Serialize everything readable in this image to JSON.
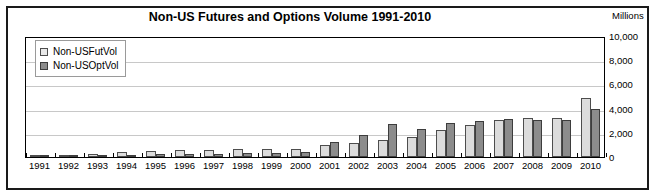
{
  "chart_data": {
    "type": "bar",
    "title": "Non-US Futures and Options Volume 1991-2010",
    "units_label": "Millions",
    "xlabel": "",
    "ylabel": "Millions",
    "ylim": [
      0,
      10000
    ],
    "ytick_labels": [
      "10,000",
      "8,000",
      "6,000",
      "4,000",
      "2,000",
      "0"
    ],
    "ytick_values": [
      10000,
      8000,
      6000,
      4000,
      2000,
      0
    ],
    "grid": true,
    "legend_position": "top-left",
    "categories": [
      "1991",
      "1992",
      "1993",
      "1994",
      "1995",
      "1996",
      "1997",
      "1998",
      "1999",
      "2000",
      "2001",
      "2002",
      "2003",
      "2004",
      "2005",
      "2006",
      "2007",
      "2008",
      "2009",
      "2010"
    ],
    "series": [
      {
        "name": "Non-USFutVol",
        "color": "#dcdcdc",
        "values": [
          80,
          170,
          290,
          420,
          470,
          560,
          590,
          640,
          640,
          690,
          1020,
          1180,
          1420,
          1620,
          2220,
          2610,
          3020,
          3240,
          3200,
          4890
        ]
      },
      {
        "name": "Non-USOptVol",
        "color": "#8c8c8c",
        "values": [
          40,
          70,
          140,
          200,
          210,
          250,
          280,
          310,
          320,
          420,
          1230,
          1860,
          2700,
          2340,
          2820,
          2950,
          3180,
          3080,
          3070,
          3930
        ]
      }
    ]
  },
  "legend": {
    "items": [
      {
        "label": "Non-USFutVol",
        "swatch": "fut"
      },
      {
        "label": "Non-USOptVol",
        "swatch": "opt"
      }
    ]
  }
}
